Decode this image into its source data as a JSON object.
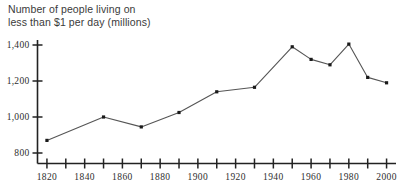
{
  "chart_data": {
    "type": "line",
    "title": "Number of people living on\nless than $1 per day (millions)",
    "title_line1": "Number of people living on",
    "title_line2": "less than $1 per day (millions)",
    "xlabel": "",
    "ylabel": "",
    "x": [
      1820,
      1850,
      1870,
      1890,
      1910,
      1930,
      1950,
      1960,
      1970,
      1980,
      1990,
      2000
    ],
    "values": [
      870,
      1000,
      945,
      1025,
      1140,
      1165,
      1390,
      1320,
      1290,
      1405,
      1220,
      1190
    ],
    "xlim": [
      1815,
      2005
    ],
    "ylim": [
      760,
      1440
    ],
    "grid": false,
    "legend": false,
    "legend_position": "none",
    "x_tick_values": [
      1820,
      1830,
      1840,
      1850,
      1860,
      1870,
      1880,
      1890,
      1900,
      1910,
      1920,
      1930,
      1940,
      1950,
      1960,
      1970,
      1980,
      1990,
      2000
    ],
    "x_tick_labels": [
      "1820",
      "",
      "1840",
      "",
      "1860",
      "",
      "1880",
      "",
      "1900",
      "",
      "1920",
      "",
      "1940",
      "",
      "1960",
      "",
      "1980",
      "",
      "2000"
    ],
    "y_tick_values": [
      800,
      1000,
      1200,
      1400
    ],
    "y_tick_labels": [
      "800",
      "1,000",
      "1,200",
      "1,400"
    ],
    "line_color": "#555555",
    "marker_color": "#1a1a1a",
    "axis_color": "#222222",
    "title_color": "#3a3a3a",
    "background": "#ffffff"
  }
}
